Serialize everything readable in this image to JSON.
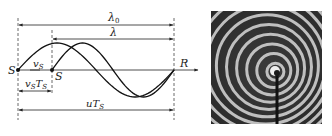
{
  "diagram": {
    "labels": {
      "lambda0": "λ",
      "lambda0_sub": "0",
      "lambda": "λ",
      "source_left": "S",
      "source_right": "S",
      "receiver": "R",
      "vs": "v",
      "vs_sub": "S",
      "vsTs_v": "v",
      "vsTs_sub1": "S",
      "vsTs_T": "T",
      "vsTs_sub2": "S",
      "uTs_u": "uT",
      "uTs_sub": "S"
    },
    "waves": [
      {
        "name": "wave-original",
        "description": "sine wave from S (left)"
      },
      {
        "name": "wave-shifted",
        "description": "sine wave from S (moved source)"
      }
    ]
  },
  "photo": {
    "description": "concentric ripple rings from moving source with stick",
    "icon": "ripple-photo"
  }
}
